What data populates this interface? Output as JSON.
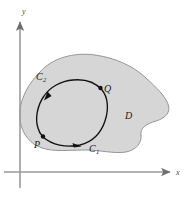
{
  "figure": {
    "name": "green-theorem-region-diagram",
    "background_color": "#ffffff"
  },
  "axes": {
    "x_label": "x",
    "y_label": "y",
    "color": "#9a9a9a",
    "arrowhead_color": "#6e6e6e"
  },
  "region": {
    "label": "D",
    "fill_color": "#d6d6d6",
    "stroke_color": "#8c8c8c"
  },
  "curve": {
    "stroke_color": "#111111",
    "arcs": [
      {
        "label": "C",
        "subscript": "1"
      },
      {
        "label": "C",
        "subscript": "2"
      }
    ]
  },
  "points": [
    {
      "label": "P",
      "marker_color": "#111111"
    },
    {
      "label": "Q",
      "marker_color": "#111111"
    }
  ]
}
